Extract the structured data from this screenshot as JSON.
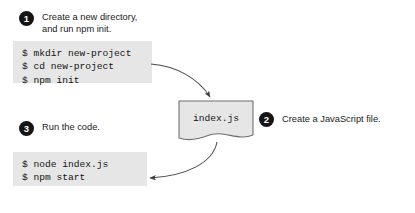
{
  "diagram": {
    "background_color": "#ffffff",
    "badge_color": "#151515",
    "code_background": "#e6e6e6",
    "doc_fill": "#e6e6e6",
    "doc_border": "#6f6f6f",
    "arrow_color": "#4a4a4a"
  },
  "steps": [
    {
      "number": "1",
      "caption": "Create a new directory,\nand run npm init."
    },
    {
      "number": "2",
      "caption": "Create a JavaScript file."
    },
    {
      "number": "3",
      "caption": "Run the code."
    }
  ],
  "code_blocks": [
    {
      "name": "init-commands",
      "lines": "$ mkdir new-project\n$ cd new-project\n$ npm init"
    },
    {
      "name": "run-commands",
      "lines": "$ node index.js\n$ npm start"
    }
  ],
  "document": {
    "filename": "index.js"
  }
}
